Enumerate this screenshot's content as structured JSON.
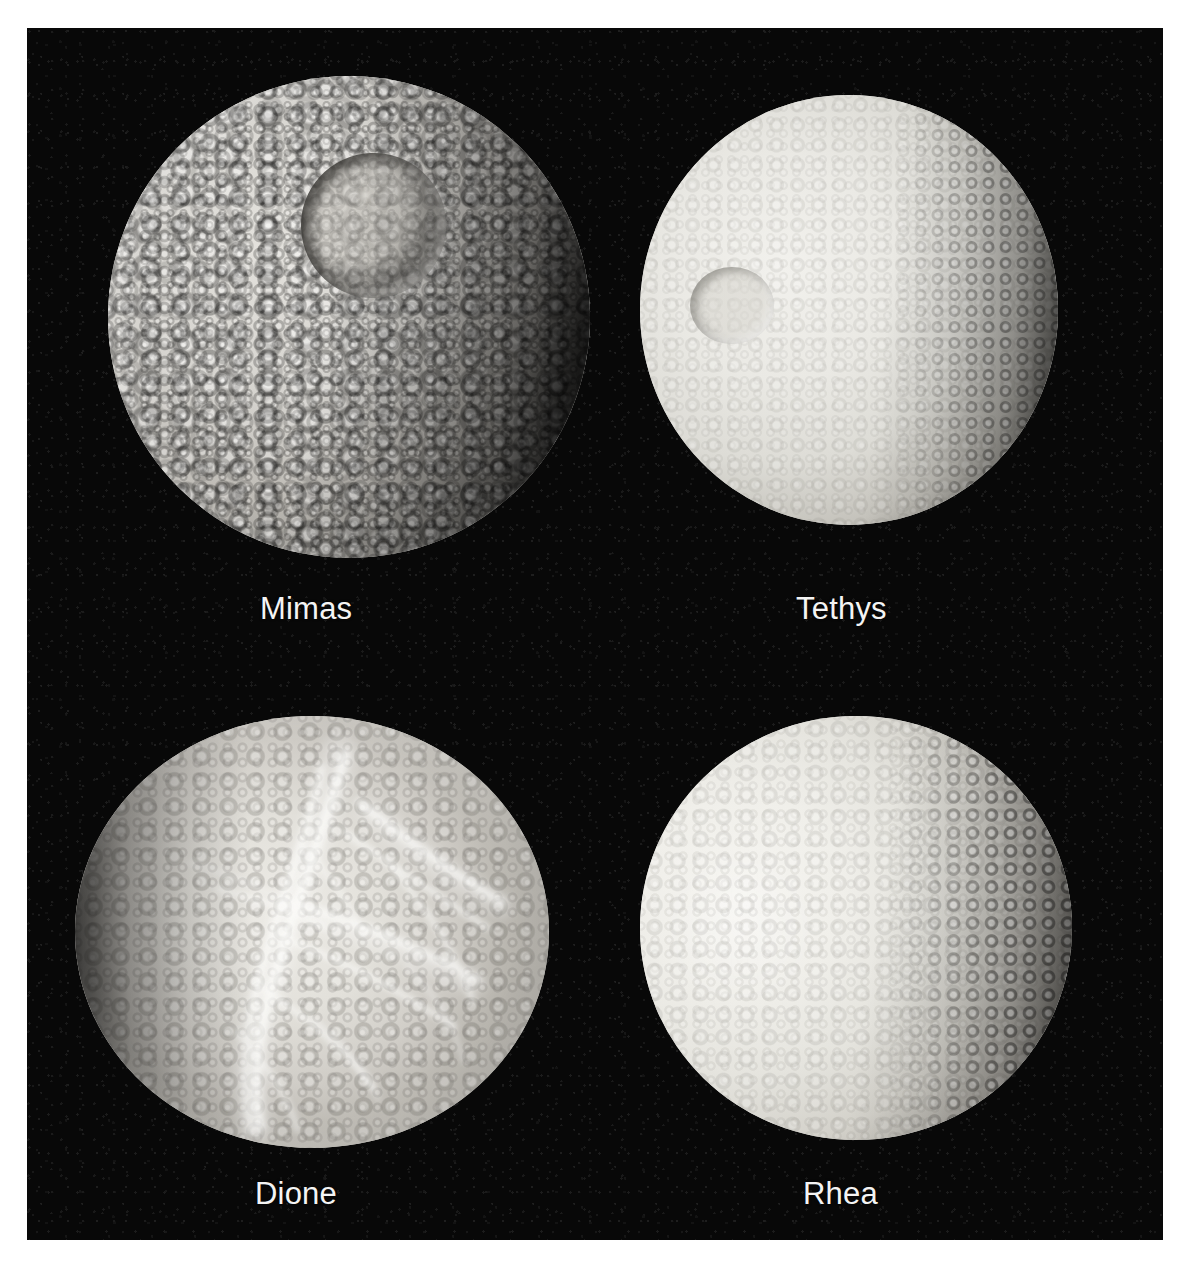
{
  "page": {
    "background_color": "#ffffff",
    "panel_color": "#080808",
    "caption_color": "#f4f4f4"
  },
  "figure": {
    "layout": "2x2 grid of moon photographs",
    "cells": [
      {
        "id": "mimas",
        "label": "Mimas",
        "position": "top-left",
        "features": "heavily cratered icy surface; large Herschel impact crater upper right; dark terminator along right limb"
      },
      {
        "id": "tethys",
        "label": "Tethys",
        "position": "top-right",
        "features": "bright smooth icy surface; large shallow crater left of center; cratered right limb"
      },
      {
        "id": "dione",
        "label": "Dione",
        "position": "bottom-left",
        "features": "bright wispy streaks (chasmata) across trailing hemisphere; cratered left limb"
      },
      {
        "id": "rhea",
        "label": "Rhea",
        "position": "bottom-right",
        "features": "bright heavily cratered surface; dense crater shadows along right terminator; bright highlight left of center"
      }
    ]
  }
}
